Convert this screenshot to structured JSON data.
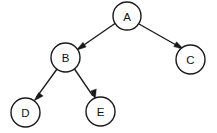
{
  "diagram": {
    "type": "directed-tree",
    "canvas": {
      "width": 217,
      "height": 133,
      "background": "#ffffff"
    },
    "style": {
      "node_fill": "#ffffff",
      "node_stroke": "#1a1a1a",
      "node_radius": 14.5,
      "edge_stroke": "#1a1a1a",
      "label_color": "#111111"
    },
    "nodes": [
      {
        "id": "A",
        "label": "A",
        "cx": 127.0,
        "cy": 16.0,
        "r": 14.0
      },
      {
        "id": "B",
        "label": "B",
        "cx": 65.5,
        "cy": 57.5,
        "r": 14.5
      },
      {
        "id": "C",
        "label": "C",
        "cx": 190.5,
        "cy": 59.5,
        "r": 14.5
      },
      {
        "id": "D",
        "label": "D",
        "cx": 25.5,
        "cy": 112.5,
        "r": 14.5
      },
      {
        "id": "E",
        "label": "E",
        "cx": 100.5,
        "cy": 111.5,
        "r": 14.5
      }
    ],
    "edges": [
      {
        "id": "A-B",
        "from": "A",
        "to": "B",
        "label": "",
        "x1": 115.0,
        "y1": 23.5,
        "x2": 77.5,
        "y2": 49.5
      },
      {
        "id": "A-C",
        "from": "A",
        "to": "C",
        "label": "",
        "x1": 139.0,
        "y1": 24.0,
        "x2": 182.0,
        "y2": 48.5
      },
      {
        "id": "B-D",
        "from": "B",
        "to": "D",
        "label": "",
        "x1": 57.0,
        "y1": 69.0,
        "x2": 34.5,
        "y2": 100.0
      },
      {
        "id": "B-E",
        "from": "B",
        "to": "E",
        "label": "",
        "x1": 74.5,
        "y1": 69.0,
        "x2": 94.5,
        "y2": 98.5
      }
    ]
  }
}
